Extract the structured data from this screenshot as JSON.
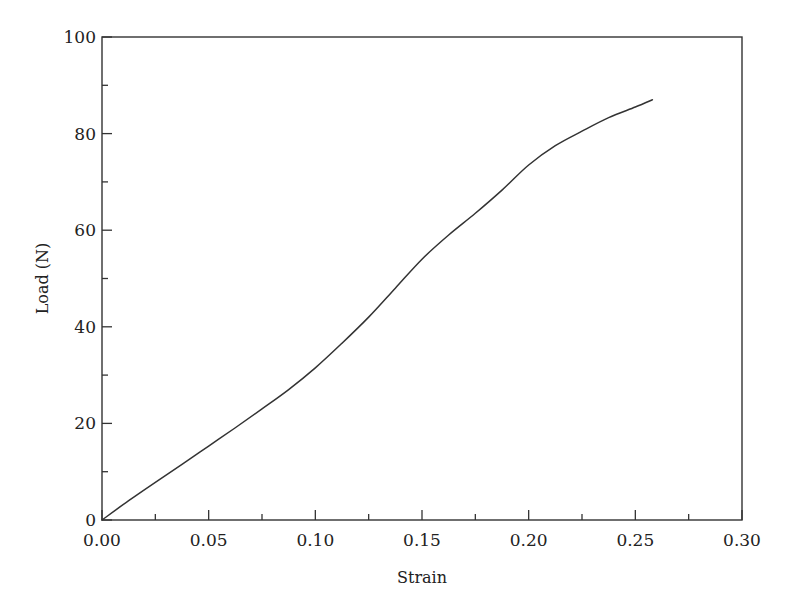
{
  "chart_data": {
    "type": "line",
    "title": "",
    "xlabel": "Strain",
    "ylabel": "Load (N)",
    "xlim": [
      0.0,
      0.3
    ],
    "ylim": [
      0,
      100
    ],
    "grid": false,
    "legend": null,
    "x_ticks": [
      0.0,
      0.05,
      0.1,
      0.15,
      0.2,
      0.25,
      0.3
    ],
    "x_tick_labels": [
      "0.00",
      "0.05",
      "0.10",
      "0.15",
      "0.20",
      "0.25",
      "0.30"
    ],
    "x_minor_ticks": [
      0.025,
      0.075,
      0.125,
      0.175,
      0.225,
      0.275
    ],
    "y_ticks": [
      0,
      20,
      40,
      60,
      80,
      100
    ],
    "y_tick_labels": [
      "0",
      "20",
      "40",
      "60",
      "80",
      "100"
    ],
    "y_minor_ticks": [
      10,
      30,
      50,
      70,
      90
    ],
    "series": [
      {
        "name": "Load vs Strain",
        "color": "#333333",
        "x": [
          0.0,
          0.0125,
          0.025,
          0.0375,
          0.05,
          0.0625,
          0.075,
          0.0875,
          0.1,
          0.1125,
          0.125,
          0.1375,
          0.15,
          0.1625,
          0.175,
          0.1875,
          0.2,
          0.2125,
          0.225,
          0.2375,
          0.25,
          0.258
        ],
        "y": [
          0.0,
          4.0,
          7.8,
          11.5,
          15.3,
          19.1,
          23.0,
          27.0,
          31.5,
          36.6,
          42.0,
          48.0,
          54.0,
          59.0,
          63.5,
          68.3,
          73.5,
          77.5,
          80.5,
          83.3,
          85.5,
          87.0
        ]
      }
    ]
  },
  "plot_area": {
    "left": 102,
    "top": 37,
    "right": 742,
    "bottom": 520
  }
}
